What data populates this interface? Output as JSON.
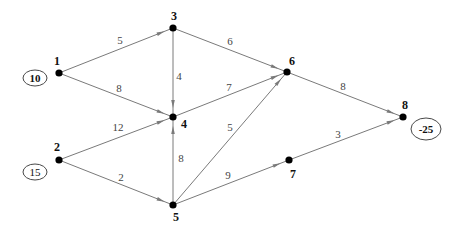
{
  "diagram": {
    "type": "directed-network-flow",
    "nodes": [
      {
        "id": "1",
        "label": "1",
        "x": 59,
        "y": 73,
        "lx": 57,
        "ly": 65
      },
      {
        "id": "2",
        "label": "2",
        "x": 59,
        "y": 160,
        "lx": 57,
        "ly": 151
      },
      {
        "id": "3",
        "label": "3",
        "x": 173,
        "y": 28,
        "lx": 174,
        "ly": 20
      },
      {
        "id": "4",
        "label": "4",
        "x": 173,
        "y": 117,
        "lx": 184,
        "ly": 128
      },
      {
        "id": "5",
        "label": "5",
        "x": 173,
        "y": 205,
        "lx": 176,
        "ly": 221
      },
      {
        "id": "6",
        "label": "6",
        "x": 287,
        "y": 72,
        "lx": 292,
        "ly": 65
      },
      {
        "id": "7",
        "label": "7",
        "x": 289,
        "y": 160,
        "lx": 293,
        "ly": 178
      },
      {
        "id": "8",
        "label": "8",
        "x": 403,
        "y": 117,
        "lx": 405,
        "ly": 109
      }
    ],
    "edges": [
      {
        "from": "1",
        "to": "3",
        "weight": "5",
        "lx": 120,
        "ly": 44
      },
      {
        "from": "1",
        "to": "4",
        "weight": "8",
        "lx": 119,
        "ly": 92
      },
      {
        "from": "3",
        "to": "4",
        "weight": "4",
        "lx": 179,
        "ly": 80
      },
      {
        "from": "3",
        "to": "6",
        "weight": "6",
        "lx": 230,
        "ly": 45
      },
      {
        "from": "4",
        "to": "6",
        "weight": "7",
        "lx": 229,
        "ly": 91
      },
      {
        "from": "2",
        "to": "4",
        "weight": "12",
        "lx": 118,
        "ly": 131
      },
      {
        "from": "2",
        "to": "5",
        "weight": "2",
        "lx": 121,
        "ly": 181
      },
      {
        "from": "5",
        "to": "4",
        "weight": "8",
        "lx": 181,
        "ly": 162
      },
      {
        "from": "5",
        "to": "6",
        "weight": "5",
        "lx": 230,
        "ly": 131
      },
      {
        "from": "5",
        "to": "7",
        "weight": "9",
        "lx": 228,
        "ly": 179
      },
      {
        "from": "6",
        "to": "8",
        "weight": "8",
        "lx": 343,
        "ly": 90
      },
      {
        "from": "7",
        "to": "8",
        "weight": "3",
        "lx": 338,
        "ly": 138
      }
    ],
    "supplies": [
      {
        "node": "1",
        "value": "10",
        "cx": 35,
        "cy": 78,
        "rx": 12,
        "ry": 8,
        "bold": true
      },
      {
        "node": "2",
        "value": "15",
        "cx": 35,
        "cy": 172,
        "rx": 12,
        "ry": 8,
        "bold": false
      },
      {
        "node": "8",
        "value": "-25",
        "cx": 426,
        "cy": 129,
        "rx": 15,
        "ry": 11,
        "bold": true
      }
    ]
  },
  "colors": {
    "edge": "#7a7a7a",
    "node": "#000000",
    "label": "#111111"
  }
}
